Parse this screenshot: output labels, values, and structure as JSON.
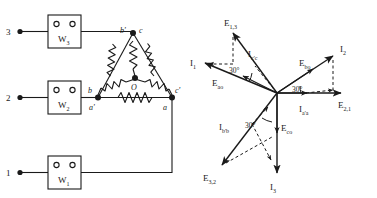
{
  "figure": {
    "stroke_color": "#1a1a1a",
    "background": "#ffffff"
  },
  "circuit": {
    "name": "three-phase-delta-circuit",
    "terminals": [
      {
        "id": "t3",
        "label": "3",
        "x": 8,
        "y": 31
      },
      {
        "id": "t2",
        "label": "2",
        "x": 8,
        "y": 97
      },
      {
        "id": "t1",
        "label": "1",
        "x": 8,
        "y": 172
      }
    ],
    "wattmeters": [
      {
        "id": "w3",
        "label": "W",
        "sub": "3",
        "x": 48,
        "y": 15,
        "w": 33,
        "h": 33
      },
      {
        "id": "w2",
        "label": "W",
        "sub": "2",
        "x": 48,
        "y": 81,
        "w": 33,
        "h": 33
      },
      {
        "id": "w1",
        "label": "W",
        "sub": "1",
        "x": 48,
        "y": 156,
        "w": 33,
        "h": 33
      }
    ],
    "delta_nodes": [
      {
        "id": "top",
        "labels": [
          "b'",
          "c"
        ],
        "x": 133,
        "y": 33
      },
      {
        "id": "bottom-left",
        "labels": [
          "b",
          "a'"
        ],
        "x": 98,
        "y": 97
      },
      {
        "id": "bottom-right",
        "labels": [
          "c'",
          "a"
        ],
        "x": 172,
        "y": 97
      },
      {
        "id": "center",
        "labels": [
          "O"
        ],
        "x": 135,
        "y": 78
      }
    ],
    "node_labels": {
      "top_left": "b'",
      "top_right": "c",
      "bl_upper": "b",
      "bl_lower": "a'",
      "br_upper": "c'",
      "br_lower": "a",
      "center": "O"
    }
  },
  "phasor": {
    "name": "phasor-diagram",
    "origin": {
      "x": 277,
      "y": 93
    },
    "angle_labels": [
      "30°",
      "30°",
      "30°"
    ],
    "vectors": [
      {
        "id": "e13",
        "label": "E",
        "sub": "1,3",
        "style": "solid",
        "lx": 224,
        "ly": 22
      },
      {
        "id": "i1",
        "label": "I",
        "sub": "1",
        "style": "solid",
        "lx": 192,
        "ly": 62
      },
      {
        "id": "icc",
        "label": "I",
        "sub": "c'c",
        "style": "dashed",
        "lx": 250,
        "ly": 55
      },
      {
        "id": "eao",
        "label": "E",
        "sub": "ao",
        "style": "solid",
        "lx": 214,
        "ly": 82
      },
      {
        "id": "ebo",
        "label": "E",
        "sub": "bo",
        "style": "solid",
        "lx": 303,
        "ly": 64
      },
      {
        "id": "i2",
        "label": "I",
        "sub": "2",
        "style": "solid",
        "lx": 348,
        "ly": 48
      },
      {
        "id": "iaa",
        "label": "I",
        "sub": "a'a",
        "style": "dashed",
        "lx": 302,
        "ly": 110
      },
      {
        "id": "e21",
        "label": "E",
        "sub": "2,1",
        "style": "solid",
        "lx": 342,
        "ly": 107
      },
      {
        "id": "ibb",
        "label": "I",
        "sub": "b'b",
        "style": "dashed",
        "lx": 222,
        "ly": 131
      },
      {
        "id": "eco",
        "label": "E",
        "sub": "co",
        "style": "solid",
        "lx": 272,
        "ly": 135
      },
      {
        "id": "e32",
        "label": "E",
        "sub": "3,2",
        "style": "solid",
        "lx": 206,
        "ly": 180
      },
      {
        "id": "i3",
        "label": "I",
        "sub": "3",
        "style": "solid",
        "lx": 273,
        "ly": 186
      }
    ]
  }
}
